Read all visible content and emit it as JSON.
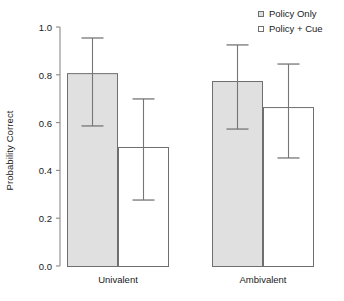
{
  "chart_data": {
    "type": "bar",
    "title": "",
    "xlabel": "",
    "ylabel": "Probability Correct",
    "categories": [
      "Univalent",
      "Ambivalent"
    ],
    "ylim": [
      0.0,
      1.0
    ],
    "ytick_labels": [
      "0.0",
      "0.2",
      "0.4",
      "0.6",
      "0.8",
      "1.0"
    ],
    "ytick_values": [
      0.0,
      0.2,
      0.4,
      0.6,
      0.8,
      1.0
    ],
    "grid": false,
    "legend_position": "top-right",
    "series": [
      {
        "name": "Policy Only",
        "fill": "#e0e0e0",
        "edge": "#6f6f6f",
        "values": [
          0.807,
          0.774
        ],
        "error_upper": [
          0.954,
          0.925
        ],
        "error_lower": [
          0.586,
          0.573
        ]
      },
      {
        "name": "Policy + Cue",
        "fill": "#ffffff",
        "edge": "#6f6f6f",
        "values": [
          0.498,
          0.665
        ],
        "error_upper": [
          0.699,
          0.845
        ],
        "error_lower": [
          0.276,
          0.452
        ]
      }
    ]
  },
  "legend": {
    "items": [
      {
        "label": "Policy Only",
        "swatch_fill": "#e0e0e0"
      },
      {
        "label": "Policy + Cue",
        "swatch_fill": "#ffffff"
      }
    ]
  },
  "axis": {
    "y_title": "Probability Correct",
    "axis_color": "#8a8a8a",
    "text_color": "#1a1a1a"
  }
}
